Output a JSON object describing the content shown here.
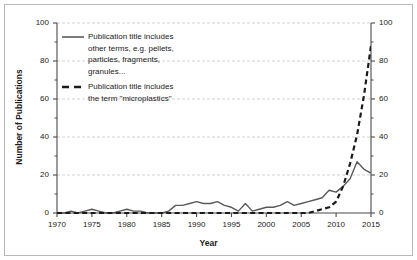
{
  "chart_data": {
    "type": "line",
    "title": "",
    "xlabel": "Year",
    "ylabel": "Number of Publications",
    "xlim": [
      1970,
      2015
    ],
    "ylim": [
      0,
      100
    ],
    "xticks": [
      1970,
      1975,
      1980,
      1985,
      1990,
      1995,
      2000,
      2005,
      2010,
      2015
    ],
    "yticks": [
      0,
      20,
      40,
      60,
      80,
      100
    ],
    "y_minor_step": 10,
    "grid": "horizontal-dashed",
    "dual_y_axis": true,
    "right_yticks": [
      0,
      20,
      40,
      60,
      80,
      100
    ],
    "legend_position": "upper-left-inside",
    "x": [
      1970,
      1971,
      1972,
      1973,
      1974,
      1975,
      1976,
      1977,
      1978,
      1979,
      1980,
      1981,
      1982,
      1983,
      1984,
      1985,
      1986,
      1987,
      1988,
      1989,
      1990,
      1991,
      1992,
      1993,
      1994,
      1995,
      1996,
      1997,
      1998,
      1999,
      2000,
      2001,
      2002,
      2003,
      2004,
      2005,
      2006,
      2007,
      2008,
      2009,
      2010,
      2011,
      2012,
      2013,
      2014,
      2015
    ],
    "series": [
      {
        "name": "Publication title includes other terms, e.g. pellets, particles, fragments, granules...",
        "style": "solid",
        "color": "#595959",
        "values": [
          0,
          0,
          1,
          0,
          1,
          2,
          1,
          0,
          0,
          1,
          2,
          1,
          1,
          0,
          0,
          0,
          1,
          4,
          4,
          5,
          6,
          5,
          5,
          6,
          4,
          3,
          1,
          5,
          1,
          2,
          3,
          3,
          4,
          6,
          4,
          5,
          6,
          7,
          8,
          12,
          11,
          14,
          18,
          27,
          23,
          21
        ]
      },
      {
        "name": "Publication title includes the term \"microplastics\"",
        "style": "dashed",
        "color": "#1a1a1a",
        "values": [
          0,
          0,
          0,
          0,
          0,
          0,
          0,
          0,
          0,
          0,
          0,
          0,
          0,
          0,
          0,
          0,
          0,
          0,
          0,
          0,
          0,
          0,
          0,
          0,
          0,
          0,
          0,
          0,
          0,
          0,
          0,
          0,
          0,
          0,
          0,
          0,
          0,
          1,
          2,
          3,
          6,
          14,
          26,
          41,
          62,
          88
        ]
      }
    ]
  },
  "legend": {
    "entries": [
      {
        "style": "solid",
        "lines": [
          "Publication title includes",
          "other terms, e.g. pellets,",
          "particles, fragments,",
          "granules..."
        ]
      },
      {
        "style": "dashed",
        "lines": [
          "Publication title includes",
          "the term \"microplastics\""
        ]
      }
    ]
  }
}
